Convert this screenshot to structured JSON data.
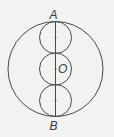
{
  "diagram": {
    "type": "geometry",
    "labels": {
      "top": "A",
      "center": "O",
      "bottom": "B"
    },
    "colors": {
      "stroke": "#4a4a4a",
      "background": "#f2f2f0",
      "text": "#3a3a3a"
    }
  }
}
